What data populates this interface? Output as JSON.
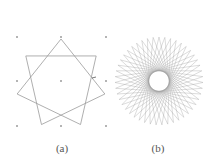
{
  "figure": {
    "panels": [
      {
        "id": "a",
        "label": "(a)",
        "description": "Seven-pointed star polygon {7/2} on a 3x3 grid of dots",
        "star": {
          "points": 7,
          "step": 2,
          "center": [
            61,
            84
          ],
          "radius": 45,
          "rotation_deg": -90
        },
        "grid_dots": [
          [
            17,
            37
          ],
          [
            61,
            37
          ],
          [
            106,
            37
          ],
          [
            17,
            81
          ],
          [
            61,
            81
          ],
          [
            106,
            81
          ],
          [
            17,
            126
          ],
          [
            61,
            126
          ],
          [
            106,
            126
          ]
        ],
        "marker": [
          94,
          78
        ]
      },
      {
        "id": "b",
        "label": "(b)",
        "description": "Dense star polygon rosette with a circular hole in the center",
        "star": {
          "points": 47,
          "step": 20,
          "center": [
            159,
            81
          ],
          "radius": 44,
          "rotation_deg": -90
        }
      }
    ],
    "colors": {
      "line": "#9a9a9a",
      "dot": "#555555",
      "caption": "#555555",
      "background": "#ffffff"
    }
  }
}
